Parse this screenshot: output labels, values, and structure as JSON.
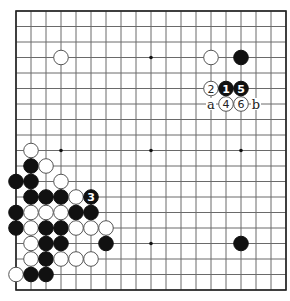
{
  "diagram": {
    "type": "go-board",
    "size": 19,
    "origin_x": 16,
    "origin_y": 11,
    "spacing_x": 15,
    "spacing_y": 15.5,
    "stone_radius": 7.3,
    "colors": {
      "black": "#111111",
      "white": "#ffffff",
      "line": "#6a6a6a"
    },
    "star_points": [
      [
        3,
        3
      ],
      [
        9,
        3
      ],
      [
        15,
        3
      ],
      [
        3,
        9
      ],
      [
        9,
        9
      ],
      [
        15,
        9
      ],
      [
        3,
        15
      ],
      [
        9,
        15
      ],
      [
        15,
        15
      ]
    ],
    "stones": [
      {
        "col": 3,
        "row": 3,
        "color": "white"
      },
      {
        "col": 13,
        "row": 3,
        "color": "white"
      },
      {
        "col": 15,
        "row": 3,
        "color": "black"
      },
      {
        "col": 13,
        "row": 5,
        "color": "white",
        "number": "2"
      },
      {
        "col": 14,
        "row": 5,
        "color": "black",
        "number": "1"
      },
      {
        "col": 15,
        "row": 5,
        "color": "black",
        "number": "5"
      },
      {
        "col": 14,
        "row": 6,
        "color": "white",
        "number": "4"
      },
      {
        "col": 15,
        "row": 6,
        "color": "white",
        "number": "6"
      },
      {
        "col": 1,
        "row": 9,
        "color": "white"
      },
      {
        "col": 1,
        "row": 10,
        "color": "black"
      },
      {
        "col": 2,
        "row": 10,
        "color": "white"
      },
      {
        "col": 0,
        "row": 11,
        "color": "black"
      },
      {
        "col": 1,
        "row": 11,
        "color": "black"
      },
      {
        "col": 3,
        "row": 11,
        "color": "white"
      },
      {
        "col": 1,
        "row": 12,
        "color": "black"
      },
      {
        "col": 2,
        "row": 12,
        "color": "black"
      },
      {
        "col": 3,
        "row": 12,
        "color": "black"
      },
      {
        "col": 4,
        "row": 12,
        "color": "white"
      },
      {
        "col": 5,
        "row": 12,
        "color": "black",
        "number": "3"
      },
      {
        "col": 0,
        "row": 13,
        "color": "black"
      },
      {
        "col": 1,
        "row": 13,
        "color": "white"
      },
      {
        "col": 2,
        "row": 13,
        "color": "white"
      },
      {
        "col": 3,
        "row": 13,
        "color": "white"
      },
      {
        "col": 4,
        "row": 13,
        "color": "black"
      },
      {
        "col": 5,
        "row": 13,
        "color": "black"
      },
      {
        "col": 0,
        "row": 14,
        "color": "black"
      },
      {
        "col": 1,
        "row": 14,
        "color": "white"
      },
      {
        "col": 2,
        "row": 14,
        "color": "black"
      },
      {
        "col": 3,
        "row": 14,
        "color": "black"
      },
      {
        "col": 4,
        "row": 14,
        "color": "white"
      },
      {
        "col": 5,
        "row": 14,
        "color": "white"
      },
      {
        "col": 6,
        "row": 14,
        "color": "white"
      },
      {
        "col": 1,
        "row": 15,
        "color": "white"
      },
      {
        "col": 2,
        "row": 15,
        "color": "black"
      },
      {
        "col": 3,
        "row": 15,
        "color": "black"
      },
      {
        "col": 6,
        "row": 15,
        "color": "black"
      },
      {
        "col": 1,
        "row": 16,
        "color": "white"
      },
      {
        "col": 2,
        "row": 16,
        "color": "black"
      },
      {
        "col": 3,
        "row": 16,
        "color": "white"
      },
      {
        "col": 4,
        "row": 16,
        "color": "white"
      },
      {
        "col": 5,
        "row": 16,
        "color": "white"
      },
      {
        "col": 0,
        "row": 17,
        "color": "white"
      },
      {
        "col": 1,
        "row": 17,
        "color": "black"
      },
      {
        "col": 2,
        "row": 17,
        "color": "black"
      },
      {
        "col": 15,
        "row": 15,
        "color": "black"
      }
    ],
    "labels": [
      {
        "col": 13,
        "row": 6,
        "text": "a"
      },
      {
        "col": 16,
        "row": 6,
        "text": "b"
      }
    ]
  }
}
